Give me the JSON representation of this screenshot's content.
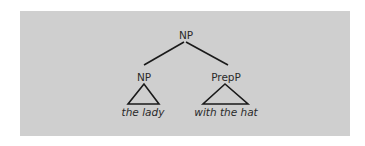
{
  "tree": {
    "root": {
      "label": "NP"
    },
    "children": [
      {
        "label": "NP",
        "leaf": "the lady",
        "collapsed": true
      },
      {
        "label": "PrepP",
        "leaf": "with the hat",
        "collapsed": true
      }
    ]
  },
  "colors": {
    "background": "#cfcfcf",
    "line": "#1a1a1a",
    "text": "#2a2a2a"
  }
}
